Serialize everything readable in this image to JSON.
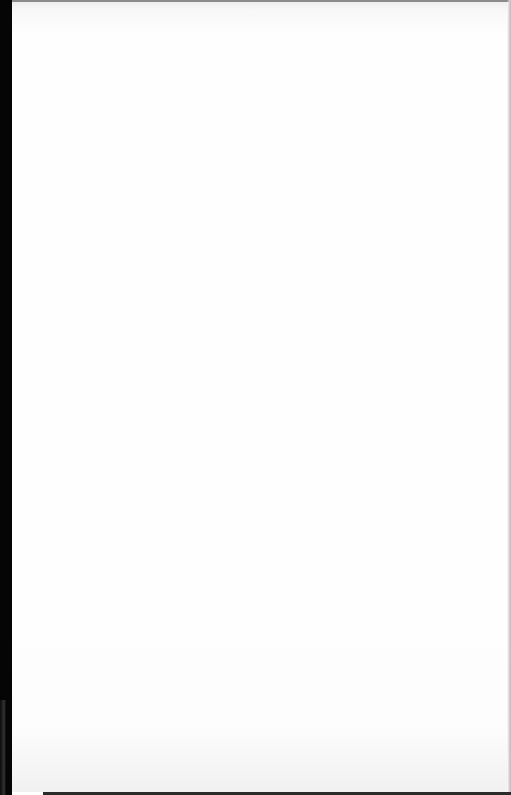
{
  "document": {
    "type": "blank-scanned-page",
    "visible_text": [],
    "colors": {
      "page": "#fefefe",
      "left_edge": "#050505",
      "bottom_edge": "#2a2a2a",
      "top_edge": "#8a8a8a",
      "right_edge": "#bdbdbd"
    }
  }
}
